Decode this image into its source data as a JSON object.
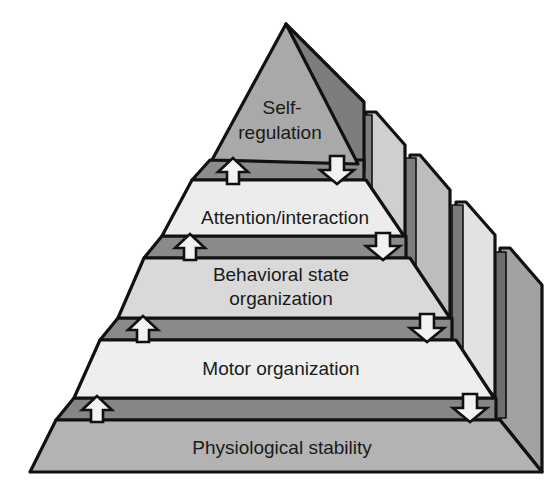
{
  "diagram": {
    "type": "pyramid",
    "title": "",
    "tiers": [
      {
        "id": "self-regulation",
        "label_lines": [
          "Self-",
          "regulation"
        ],
        "level": 5
      },
      {
        "id": "attention-interaction",
        "label_lines": [
          "Attention/interaction"
        ],
        "level": 4
      },
      {
        "id": "behavioral-state-organization",
        "label_lines": [
          "Behavioral state",
          "organization"
        ],
        "level": 3
      },
      {
        "id": "motor-organization",
        "label_lines": [
          "Motor organization"
        ],
        "level": 2
      },
      {
        "id": "physiological-stability",
        "label_lines": [
          "Physiological stability"
        ],
        "level": 1
      }
    ],
    "connectors": [
      {
        "between": [
          "self-regulation",
          "attention-interaction"
        ],
        "up_arrow": true,
        "down_arrow": true
      },
      {
        "between": [
          "attention-interaction",
          "behavioral-state-organization"
        ],
        "up_arrow": true,
        "down_arrow": true
      },
      {
        "between": [
          "behavioral-state-organization",
          "motor-organization"
        ],
        "up_arrow": true,
        "down_arrow": true
      },
      {
        "between": [
          "motor-organization",
          "physiological-stability"
        ],
        "up_arrow": true,
        "down_arrow": true
      }
    ],
    "colors": {
      "outline": "#111111",
      "band": "#8a8a8a",
      "top_face": "#a9a9a9",
      "tier_light": "#e9e9e9",
      "tier_mid": "#d6d6d6",
      "side_dark": "#7e7e7e",
      "side_light": "#c8c8c8",
      "base_face": "#b5b5b5",
      "arrow_fill": "#f2f2f2"
    }
  }
}
